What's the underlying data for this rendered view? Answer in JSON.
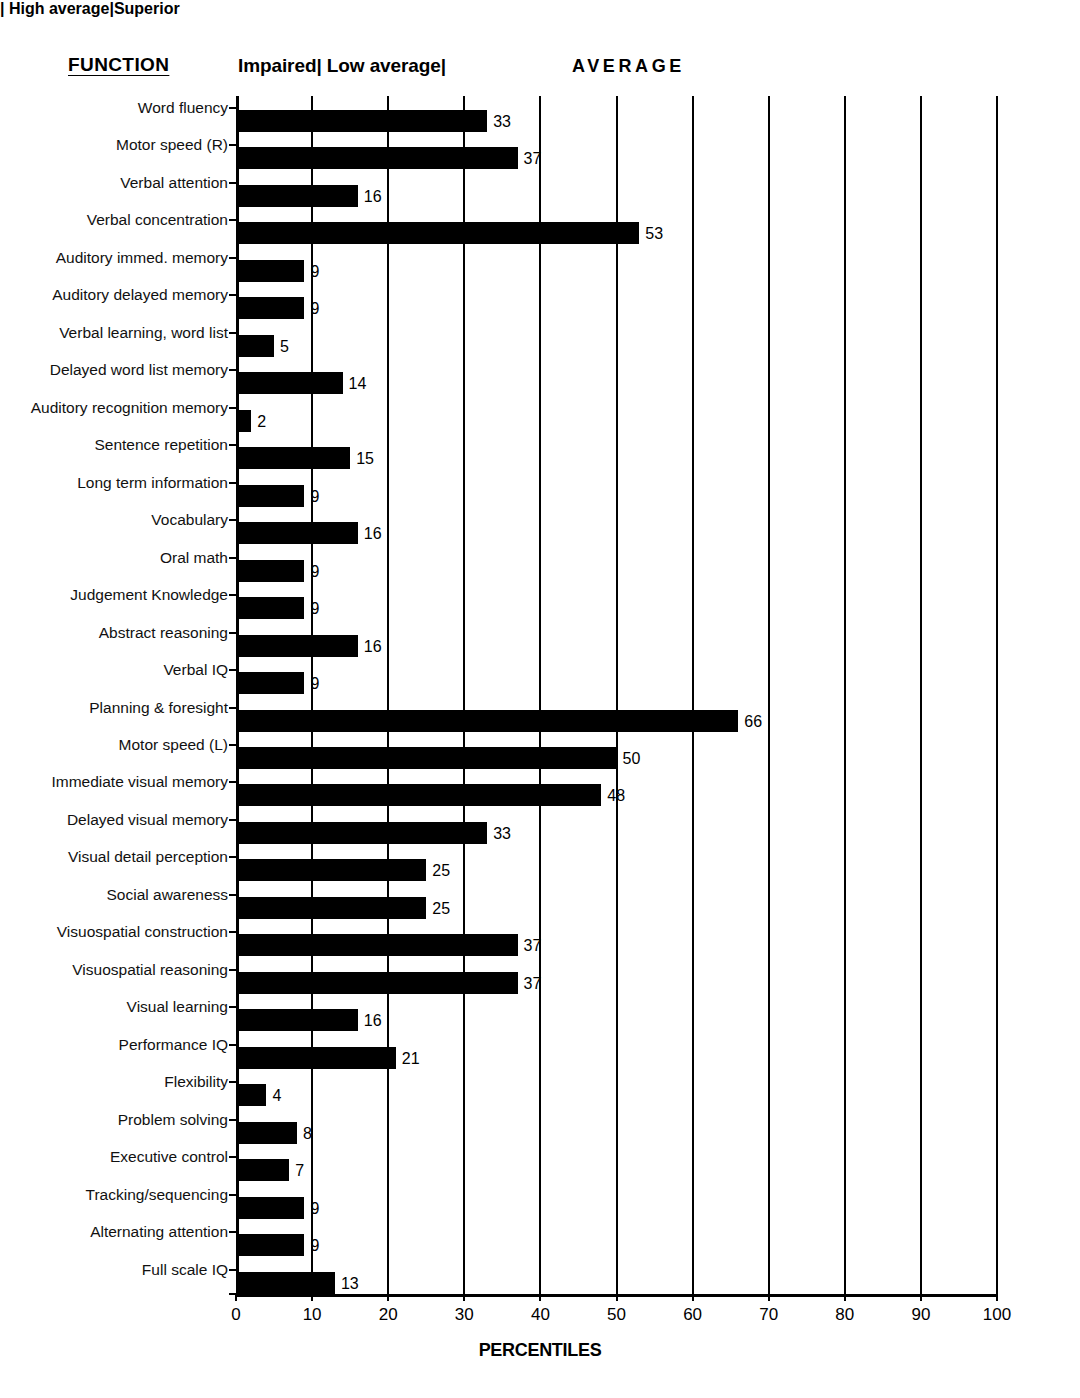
{
  "header": {
    "function_label": "FUNCTION",
    "band_impaired_low": "Impaired| Low average|",
    "band_average": "AVERAGE",
    "band_high_superior": "| High average|Superior"
  },
  "chart_data": {
    "type": "bar",
    "orientation": "horizontal",
    "title": "",
    "xlabel": "PERCENTILES",
    "ylabel": "FUNCTION",
    "xlim": [
      0,
      100
    ],
    "xticks": [
      0,
      10,
      20,
      30,
      40,
      50,
      60,
      70,
      80,
      90,
      100
    ],
    "xticklabels": [
      "0",
      "10",
      "20",
      "30",
      "40",
      "50",
      "60",
      "70",
      "80",
      "90",
      "100"
    ],
    "grid": "vertical",
    "legend": "none",
    "bar_color": "#000000",
    "categories": [
      "Word fluency",
      "Motor speed (R)",
      "Verbal attention",
      "Verbal concentration",
      "Auditory immed. memory",
      "Auditory delayed memory",
      "Verbal learning, word list",
      "Delayed word list memory",
      "Auditory recognition memory",
      "Sentence repetition",
      "Long term information",
      "Vocabulary",
      "Oral math",
      "Judgement Knowledge",
      "Abstract reasoning",
      "Verbal IQ",
      "Planning & foresight",
      "Motor speed (L)",
      "Immediate visual memory",
      "Delayed visual memory",
      "Visual detail perception",
      "Social awareness",
      "Visuospatial construction",
      "Visuospatial reasoning",
      "Visual learning",
      "Performance IQ",
      "Flexibility",
      "Problem solving",
      "Executive control",
      "Tracking/sequencing",
      "Alternating attention",
      "Full scale IQ"
    ],
    "values": [
      33,
      37,
      16,
      53,
      9,
      9,
      5,
      14,
      2,
      15,
      9,
      16,
      9,
      9,
      16,
      9,
      66,
      50,
      48,
      33,
      25,
      25,
      37,
      37,
      16,
      21,
      4,
      8,
      7,
      9,
      9,
      13
    ],
    "value_labels": [
      "33",
      "37",
      "16",
      "53",
      "9",
      "9",
      "5",
      "14",
      "2",
      "15",
      "9",
      "16",
      "9",
      "9",
      "16",
      "9",
      "66",
      "50",
      "48",
      "33",
      "25",
      "25",
      "37",
      "37",
      "16",
      "21",
      "4",
      "8",
      "7",
      "9",
      "9",
      "13"
    ],
    "bands": [
      {
        "label": "Impaired",
        "range": [
          0,
          5
        ]
      },
      {
        "label": "Low average",
        "range": [
          5,
          25
        ]
      },
      {
        "label": "AVERAGE",
        "range": [
          25,
          75
        ]
      },
      {
        "label": "High average",
        "range": [
          75,
          95
        ]
      },
      {
        "label": "Superior",
        "range": [
          95,
          100
        ]
      }
    ]
  }
}
